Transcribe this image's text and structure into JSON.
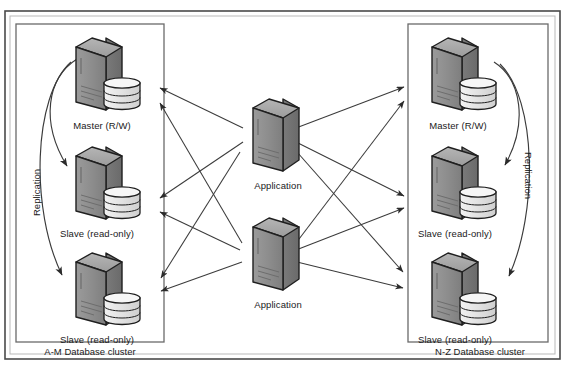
{
  "diagram": {
    "background_color": "#ffffff",
    "line_color": "#3b3b3b",
    "server_fill_front": "#8a8a8a",
    "server_fill_side": "#6f6f6f",
    "server_fill_top": "#a8a8a8",
    "disk_fill": "#e8e8e8",
    "frame_color": "#555555"
  },
  "clusters": [
    {
      "id": "left",
      "caption": "A-M Database cluster",
      "replication_label": "Replication",
      "nodes": [
        {
          "id": "left-master",
          "label": "Master (R/W)",
          "role": "master",
          "has_disk": true
        },
        {
          "id": "left-slave-1",
          "label": "Slave (read-only)",
          "role": "slave",
          "has_disk": true
        },
        {
          "id": "left-slave-2",
          "label": "Slave (read-only)",
          "role": "slave",
          "has_disk": true
        }
      ]
    },
    {
      "id": "right",
      "caption": "N-Z Database cluster",
      "replication_label": "Replication",
      "nodes": [
        {
          "id": "right-master",
          "label": "Master (R/W)",
          "role": "master",
          "has_disk": true
        },
        {
          "id": "right-slave-1",
          "label": "Slave (read-only)",
          "role": "slave",
          "has_disk": true
        },
        {
          "id": "right-slave-2",
          "label": "Slave (read-only)",
          "role": "slave",
          "has_disk": true
        }
      ]
    }
  ],
  "application_servers": [
    {
      "id": "app-1",
      "label": "Application",
      "has_disk": false
    },
    {
      "id": "app-2",
      "label": "Application",
      "has_disk": false
    }
  ],
  "labels": {
    "left_master": "Master (R/W)",
    "left_slave_1": "Slave (read-only)",
    "left_slave_2": "Slave (read-only)",
    "left_cluster_caption": "A-M Database cluster",
    "left_replication": "Replication",
    "right_master": "Master (R/W)",
    "right_slave_1": "Slave (read-only)",
    "right_slave_2": "Slave (read-only)",
    "right_cluster_caption": "N-Z Database cluster",
    "right_replication": "Replication",
    "app_1": "Application",
    "app_2": "Application"
  }
}
